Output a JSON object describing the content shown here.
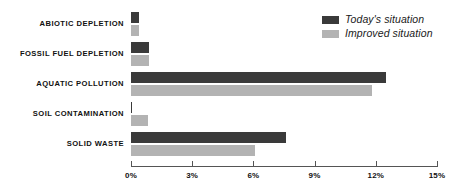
{
  "chart_data": {
    "type": "bar",
    "orientation": "horizontal",
    "title": "",
    "xlabel": "",
    "ylabel": "",
    "xlim": [
      0,
      15
    ],
    "xticks": [
      "0%",
      "3%",
      "6%",
      "9%",
      "12%",
      "15%"
    ],
    "xtick_values": [
      0,
      3,
      6,
      9,
      12,
      15
    ],
    "grid": false,
    "legend_position": "top-right",
    "categories": [
      "ABIOTIC DEPLETION",
      "FOSSIL FUEL DEPLETION",
      "AQUATIC POLLUTION",
      "SOIL CONTAMINATION",
      "SOLID WASTE"
    ],
    "series": [
      {
        "name": "Today's situation",
        "color": "#3a3a3a",
        "values": [
          0.4,
          0.9,
          12.5,
          0.05,
          7.6
        ]
      },
      {
        "name": "Improved situation",
        "color": "#b3b3b3",
        "values": [
          0.4,
          0.9,
          11.8,
          0.85,
          6.1
        ]
      }
    ]
  },
  "legend": {
    "items": [
      {
        "label": "Today's situation",
        "color": "#3a3a3a"
      },
      {
        "label": "Improved situation",
        "color": "#b3b3b3"
      }
    ]
  },
  "axis": {
    "ticks": [
      {
        "label": "0%",
        "value": 0
      },
      {
        "label": "3%",
        "value": 3
      },
      {
        "label": "6%",
        "value": 6
      },
      {
        "label": "9%",
        "value": 9
      },
      {
        "label": "12%",
        "value": 12
      },
      {
        "label": "15%",
        "value": 15
      }
    ]
  },
  "colors": {
    "today": "#3a3a3a",
    "improved": "#b3b3b3",
    "axis": "#555555",
    "text": "#111111",
    "background": "#ffffff"
  }
}
